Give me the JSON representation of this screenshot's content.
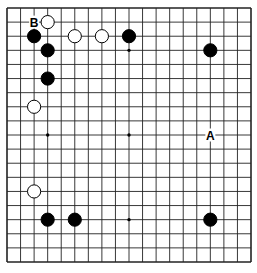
{
  "diagram": {
    "type": "go-board",
    "size": 19,
    "colors": {
      "background": "#ffffff",
      "line": "#222222",
      "black": "#000000",
      "white": "#ffffff"
    },
    "hoshi": [
      [
        3,
        3
      ],
      [
        9,
        3
      ],
      [
        15,
        3
      ],
      [
        3,
        9
      ],
      [
        9,
        9
      ],
      [
        15,
        9
      ],
      [
        3,
        15
      ],
      [
        9,
        15
      ],
      [
        15,
        15
      ]
    ],
    "stones": [
      {
        "color": "white",
        "col": 3,
        "row": 1
      },
      {
        "color": "black",
        "col": 2,
        "row": 2
      },
      {
        "color": "white",
        "col": 5,
        "row": 2
      },
      {
        "color": "white",
        "col": 7,
        "row": 2
      },
      {
        "color": "black",
        "col": 9,
        "row": 2
      },
      {
        "color": "black",
        "col": 3,
        "row": 3
      },
      {
        "color": "black",
        "col": 15,
        "row": 3
      },
      {
        "color": "black",
        "col": 3,
        "row": 5
      },
      {
        "color": "white",
        "col": 2,
        "row": 7
      },
      {
        "color": "white",
        "col": 2,
        "row": 13
      },
      {
        "color": "black",
        "col": 3,
        "row": 15
      },
      {
        "color": "black",
        "col": 5,
        "row": 15
      },
      {
        "color": "black",
        "col": 15,
        "row": 15
      }
    ],
    "labels": [
      {
        "text": "B",
        "col": 2,
        "row": 1
      },
      {
        "text": "A",
        "col": 15,
        "row": 9
      }
    ]
  }
}
